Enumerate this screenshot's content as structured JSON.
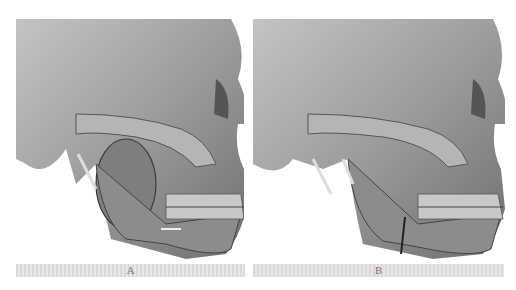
{
  "figure": {
    "panels": [
      {
        "label": "A",
        "description": "3D CT lateral view of skull showing mass in left mandibular ramus region with arrow marker",
        "icon": "skull-ct-render"
      },
      {
        "label": "B",
        "description": "3D CT lateral view of skull after resection/reconstruction showing mandibular osteotomy line",
        "icon": "skull-ct-render"
      }
    ],
    "colors": {
      "bone": "#9a9a9a",
      "bone_highlight": "#d0d0d0",
      "bone_shadow": "#3a3a3a",
      "label_bar": "#dedede",
      "label_text": "#777777"
    }
  }
}
